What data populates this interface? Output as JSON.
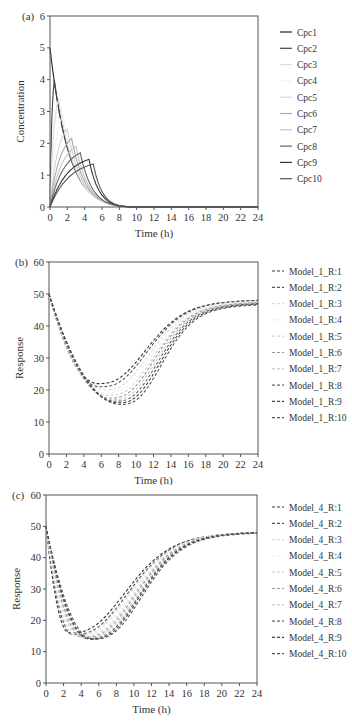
{
  "chart_data": [
    {
      "panel_label": "(a)",
      "type": "line",
      "title": "",
      "xlabel": "Time (h)",
      "ylabel": "Concentration",
      "xlim": [
        0,
        24
      ],
      "ylim": [
        0,
        6
      ],
      "xticks": [
        0,
        2,
        4,
        6,
        8,
        10,
        12,
        14,
        16,
        18,
        20,
        22,
        24
      ],
      "yticks": [
        0,
        1,
        2,
        3,
        4,
        5,
        6
      ],
      "grid": false,
      "legend_position": "right",
      "line_style": "solid",
      "series": [
        {
          "name": "Cpc1",
          "color": "#222222",
          "peak_time": 0.0,
          "peak_value": 5.0
        },
        {
          "name": "Cpc2",
          "color": "#444444",
          "peak_time": 0.5,
          "peak_value": 4.0
        },
        {
          "name": "Cpc3",
          "color": "#dddddd",
          "peak_time": 1.0,
          "peak_value": 3.4
        },
        {
          "name": "Cpc4",
          "color": "#f2f2f2",
          "peak_time": 1.5,
          "peak_value": 2.9
        },
        {
          "name": "Cpc5",
          "color": "#d6d6d6",
          "peak_time": 2.0,
          "peak_value": 2.45
        },
        {
          "name": "Cpc6",
          "color": "#aaaaaa",
          "peak_time": 2.5,
          "peak_value": 2.15
        },
        {
          "name": "Cpc7",
          "color": "#c4c4c4",
          "peak_time": 3.0,
          "peak_value": 1.9
        },
        {
          "name": "Cpc8",
          "color": "#666666",
          "peak_time": 3.5,
          "peak_value": 1.7
        },
        {
          "name": "Cpc9",
          "color": "#333333",
          "peak_time": 4.5,
          "peak_value": 1.5
        },
        {
          "name": "Cpc10",
          "color": "#555555",
          "peak_time": 5.0,
          "peak_value": 1.35
        }
      ],
      "shared_shape": {
        "start_value": 0,
        "end_time_near_zero": 9.5,
        "value_at_24": 0
      }
    },
    {
      "panel_label": "(b)",
      "type": "line",
      "title": "",
      "xlabel": "Time (h)",
      "ylabel": "Response",
      "xlim": [
        0,
        24
      ],
      "ylim": [
        0,
        60
      ],
      "xticks": [
        0,
        2,
        4,
        6,
        8,
        10,
        12,
        14,
        16,
        18,
        20,
        22,
        24
      ],
      "yticks": [
        0,
        10,
        20,
        30,
        40,
        50,
        60
      ],
      "grid": false,
      "legend_position": "right",
      "line_style": "dashed",
      "series": [
        {
          "name": "Model_1_R:1",
          "color": "#333333",
          "min_time": 5.6,
          "min_value": 22.0,
          "value_at_24": 48.0
        },
        {
          "name": "Model_1_R:2",
          "color": "#555555",
          "min_time": 5.8,
          "min_value": 21.0,
          "value_at_24": 48.0
        },
        {
          "name": "Model_1_R:3",
          "color": "#dddddd",
          "min_time": 6.2,
          "min_value": 20.0,
          "value_at_24": 47.8
        },
        {
          "name": "Model_1_R:4",
          "color": "#f0f0f0",
          "min_time": 6.5,
          "min_value": 19.0,
          "value_at_24": 47.6
        },
        {
          "name": "Model_1_R:5",
          "color": "#d4d4d4",
          "min_time": 6.8,
          "min_value": 18.3,
          "value_at_24": 47.4
        },
        {
          "name": "Model_1_R:6",
          "color": "#999999",
          "min_time": 7.0,
          "min_value": 17.5,
          "value_at_24": 47.3
        },
        {
          "name": "Model_1_R:7",
          "color": "#c8c8c8",
          "min_time": 7.3,
          "min_value": 17.0,
          "value_at_24": 47.1
        },
        {
          "name": "Model_1_R:8",
          "color": "#666666",
          "min_time": 7.6,
          "min_value": 16.5,
          "value_at_24": 47.0
        },
        {
          "name": "Model_1_R:9",
          "color": "#444444",
          "min_time": 7.9,
          "min_value": 16.0,
          "value_at_24": 46.8
        },
        {
          "name": "Model_1_R:10",
          "color": "#555555",
          "min_time": 8.2,
          "min_value": 15.5,
          "value_at_24": 46.6
        }
      ],
      "shared_shape": {
        "start_value": 50
      }
    },
    {
      "panel_label": "(c)",
      "type": "line",
      "title": "",
      "xlabel": "Time (h)",
      "ylabel": "Response",
      "xlim": [
        0,
        24
      ],
      "ylim": [
        0,
        60
      ],
      "xticks": [
        0,
        2,
        4,
        6,
        8,
        10,
        12,
        14,
        16,
        18,
        20,
        22,
        24
      ],
      "yticks": [
        0,
        10,
        20,
        30,
        40,
        50,
        60
      ],
      "grid": false,
      "legend_position": "right",
      "line_style": "dashed",
      "series": [
        {
          "name": "Model_4_R:1",
          "color": "#333333",
          "min_time": 2.6,
          "min_value": 16.0,
          "value_at_24": 48.0
        },
        {
          "name": "Model_4_R:2",
          "color": "#555555",
          "min_time": 3.0,
          "min_value": 15.5,
          "value_at_24": 48.0
        },
        {
          "name": "Model_4_R:3",
          "color": "#dddddd",
          "min_time": 3.3,
          "min_value": 15.2,
          "value_at_24": 48.0
        },
        {
          "name": "Model_4_R:4",
          "color": "#f0f0f0",
          "min_time": 3.6,
          "min_value": 15.0,
          "value_at_24": 48.0
        },
        {
          "name": "Model_4_R:5",
          "color": "#d4d4d4",
          "min_time": 3.9,
          "min_value": 14.8,
          "value_at_24": 48.0
        },
        {
          "name": "Model_4_R:6",
          "color": "#999999",
          "min_time": 4.2,
          "min_value": 14.6,
          "value_at_24": 48.0
        },
        {
          "name": "Model_4_R:7",
          "color": "#c8c8c8",
          "min_time": 4.5,
          "min_value": 14.4,
          "value_at_24": 48.0
        },
        {
          "name": "Model_4_R:8",
          "color": "#666666",
          "min_time": 4.8,
          "min_value": 14.2,
          "value_at_24": 48.0
        },
        {
          "name": "Model_4_R:9",
          "color": "#444444",
          "min_time": 5.0,
          "min_value": 14.0,
          "value_at_24": 48.0
        },
        {
          "name": "Model_4_R:10",
          "color": "#555555",
          "min_time": 5.3,
          "min_value": 14.0,
          "value_at_24": 47.8
        }
      ],
      "shared_shape": {
        "start_value": 50
      }
    }
  ],
  "layout": {
    "axis_color": "#555555",
    "panels": [
      {
        "top": 0,
        "height": 245,
        "plot": {
          "x0": 50,
          "x1": 258,
          "y0": 207,
          "y1": 16
        },
        "legend": {
          "x": 280,
          "y": 32,
          "step": 16.3
        }
      },
      {
        "top": 245,
        "height": 240,
        "plot": {
          "x0": 49,
          "x1": 258,
          "y0": 209,
          "y1": 17
        },
        "legend": {
          "x": 272,
          "y": 26,
          "step": 16.3
        }
      },
      {
        "top": 485,
        "height": 239,
        "plot": {
          "x0": 46,
          "x1": 257,
          "y0": 198,
          "y1": 10
        },
        "legend": {
          "x": 272,
          "y": 22,
          "step": 16.3
        }
      }
    ]
  }
}
